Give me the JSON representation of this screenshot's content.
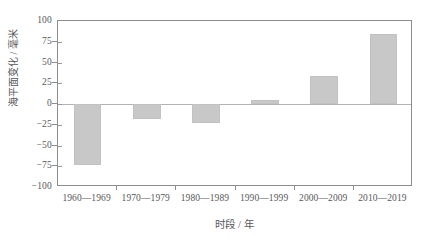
{
  "chart_data": {
    "type": "bar",
    "title": "",
    "subtitle": "",
    "xlabel": "时段 / 年",
    "ylabel": "海平面变化 / 毫米",
    "categories": [
      "1960—1969",
      "1970—1979",
      "1980—1989",
      "1990—1999",
      "2000—2009",
      "2010—2019"
    ],
    "values": [
      -73,
      -18,
      -23,
      5,
      34,
      84
    ],
    "series": [
      {
        "name": "海平面变化",
        "values": [
          -73,
          -18,
          -23,
          5,
          34,
          84
        ]
      }
    ],
    "ylim": [
      -100,
      100
    ],
    "ytick_labels": [
      "100",
      "75",
      "50",
      "25",
      "0",
      "-25",
      "-50",
      "-75",
      "-100"
    ],
    "ytick_values": [
      100,
      75,
      50,
      25,
      0,
      -25,
      -50,
      -75,
      -100
    ],
    "grid": false,
    "legend": "none",
    "zero_line": 0,
    "bar_color": "#c8c8c8",
    "axis_color": "#8d8d90",
    "text_color": "#58585a",
    "background_color": "#ffffff"
  }
}
